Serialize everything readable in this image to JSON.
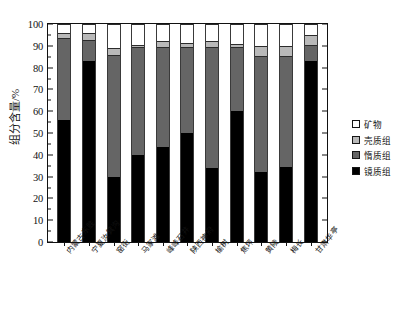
{
  "chart_data": {
    "type": "bar",
    "subtype": "stacked-column",
    "title": "",
    "xlabel": "",
    "ylabel": "组分含量/%",
    "ylim": [
      0,
      100
    ],
    "yticks": [
      0,
      10,
      20,
      30,
      40,
      50,
      60,
      70,
      80,
      90,
      100
    ],
    "grid": false,
    "legend_position": "right",
    "categories": [
      "内蒙古东胜",
      "宁夏汝箕沟",
      "窑街",
      "马家滩",
      "峰峰石井",
      "陕西神府",
      "榆树",
      "焦坪",
      "黄陵",
      "梅长",
      "甘肃华亭"
    ],
    "series": [
      {
        "name": "镜质组",
        "color": "#000000",
        "values": [
          56,
          83,
          30,
          40,
          43.5,
          50,
          34,
          60,
          32,
          34.5,
          83
        ]
      },
      {
        "name": "惰质组",
        "color": "#656565",
        "values": [
          37.5,
          9.5,
          56,
          49.5,
          46,
          39.5,
          55.5,
          29.5,
          53.5,
          51,
          7.5
        ]
      },
      {
        "name": "壳质组",
        "color": "#b9b9b9",
        "values": [
          2.5,
          3.5,
          3,
          1,
          2.5,
          2,
          2.5,
          1.5,
          4.5,
          4.5,
          4.5
        ]
      },
      {
        "name": "矿物",
        "color": "#ffffff",
        "values": [
          4,
          4,
          11,
          9.5,
          8,
          8.5,
          8,
          9,
          10,
          10,
          5
        ]
      }
    ]
  },
  "legend": {
    "items": [
      {
        "label": "矿物",
        "swatch": "sw-min"
      },
      {
        "label": "壳质组",
        "swatch": "sw-exi"
      },
      {
        "label": "惰质组",
        "swatch": "sw-ine"
      },
      {
        "label": "镜质组",
        "swatch": "sw-vit"
      }
    ]
  }
}
